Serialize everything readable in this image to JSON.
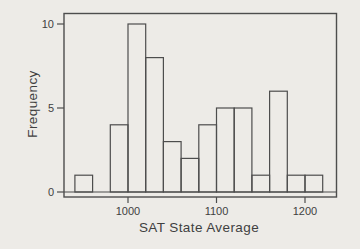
{
  "chart_data": {
    "type": "bar",
    "variant": "histogram",
    "title": "",
    "xlabel": "SAT State Average",
    "ylabel": "Frequency",
    "bin_width": 20,
    "bin_starts": [
      940,
      960,
      980,
      1000,
      1020,
      1040,
      1060,
      1080,
      1100,
      1120,
      1140,
      1160,
      1180,
      1200
    ],
    "frequencies": [
      1,
      0,
      4,
      10,
      8,
      3,
      2,
      4,
      5,
      5,
      1,
      6,
      1,
      1
    ],
    "x_ticks": [
      1000,
      1100,
      1200
    ],
    "y_ticks": [
      0,
      5,
      10
    ],
    "xlim": [
      928,
      1235
    ],
    "ylim": [
      -0.3,
      10.9
    ],
    "grid": false,
    "legend": false,
    "bar_fill": "none"
  },
  "colors": {
    "background": "#edebe7",
    "line": "#4d4d4d",
    "text": "#3f3f3f"
  }
}
